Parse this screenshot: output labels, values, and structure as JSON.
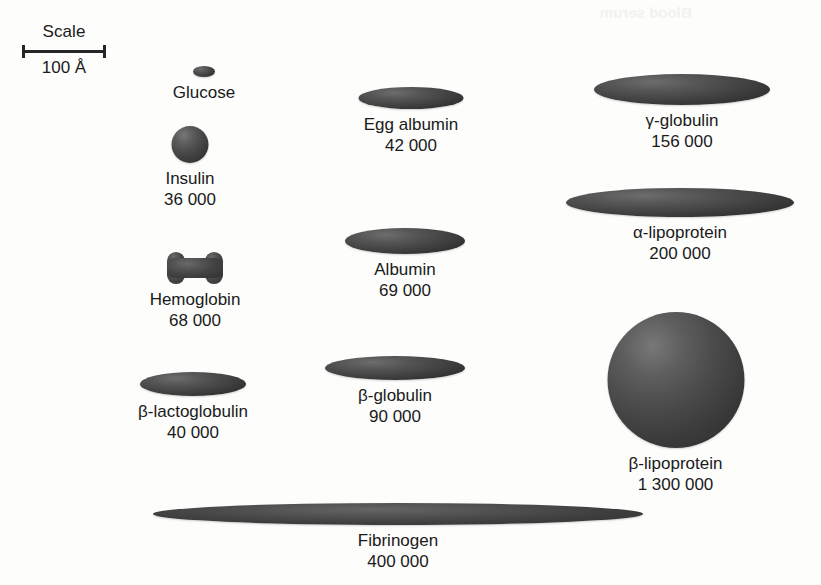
{
  "scale": {
    "title": "Scale",
    "value": "100 Å",
    "bar_pixels": 60,
    "represents_angstroms": 100
  },
  "chart_data": {
    "type": "diagram",
    "subtitle": "",
    "xlabel": "",
    "ylabel": "",
    "units": "molecular weight (daltons)",
    "scale_bar": {
      "label": "100 Å",
      "length_px": 60
    },
    "categories": [
      "Glucose",
      "Insulin",
      "Hemoglobin",
      "β-lactoglobulin",
      "Egg albumin",
      "Albumin",
      "β-globulin",
      "γ-globulin",
      "α-lipoprotein",
      "β-lipoprotein",
      "Fibrinogen"
    ],
    "values": [
      180,
      36000,
      68000,
      40000,
      42000,
      69000,
      90000,
      156000,
      200000,
      1300000,
      400000
    ],
    "value_labels": [
      "",
      "36 000",
      "68 000",
      "40 000",
      "42 000",
      "69 000",
      "90 000",
      "156 000",
      "200 000",
      "1 300 000",
      "400 000"
    ],
    "shapes": [
      "ellipse",
      "sphere",
      "lobed",
      "ellipse",
      "ellipse",
      "ellipse",
      "ellipse",
      "ellipse",
      "ellipse",
      "sphere",
      "ellipse"
    ]
  },
  "molecules": [
    {
      "id": "glucose",
      "name": "Glucose",
      "mass": "",
      "shape": "ellipse",
      "width": 22,
      "height": 11,
      "left": 145,
      "top": 66,
      "box": 118
    },
    {
      "id": "insulin",
      "name": "Insulin",
      "mass": "36 000",
      "shape": "sphere",
      "width": 37,
      "height": 37,
      "left": 120,
      "top": 126,
      "box": 140
    },
    {
      "id": "hemoglobin",
      "name": "Hemoglobin",
      "mass": "68 000",
      "shape": "lobed",
      "width": 56,
      "height": 32,
      "left": 110,
      "top": 252,
      "box": 170
    },
    {
      "id": "beta-lactoglobulin",
      "name": "β-lactoglobulin",
      "mass": "40 000",
      "shape": "ellipse",
      "width": 106,
      "height": 24,
      "left": 110,
      "top": 372,
      "box": 166
    },
    {
      "id": "egg-albumin",
      "name": "Egg albumin",
      "mass": "42 000",
      "shape": "ellipse",
      "width": 105,
      "height": 22,
      "left": 333,
      "top": 87,
      "box": 156
    },
    {
      "id": "albumin",
      "name": "Albumin",
      "mass": "69 000",
      "shape": "ellipse",
      "width": 120,
      "height": 26,
      "left": 327,
      "top": 228,
      "box": 156
    },
    {
      "id": "beta-globulin",
      "name": "β-globulin",
      "mass": "90 000",
      "shape": "ellipse",
      "width": 140,
      "height": 24,
      "left": 317,
      "top": 356,
      "box": 156
    },
    {
      "id": "gamma-globulin",
      "name": "γ-globulin",
      "mass": "156 000",
      "shape": "ellipse",
      "width": 176,
      "height": 31,
      "left": 594,
      "top": 74,
      "box": 176
    },
    {
      "id": "alpha-lipoprotein",
      "name": "α-lipoprotein",
      "mass": "200 000",
      "shape": "ellipse",
      "width": 228,
      "height": 29,
      "left": 566,
      "top": 188,
      "box": 228
    },
    {
      "id": "beta-lipoprotein",
      "name": "β-lipoprotein",
      "mass": "1 300 000",
      "shape": "sphere",
      "width": 137,
      "height": 136,
      "left": 607,
      "top": 312,
      "box": 137
    },
    {
      "id": "fibrinogen",
      "name": "Fibrinogen",
      "mass": "400 000",
      "shape": "ellipse",
      "width": 490,
      "height": 22,
      "left": 153,
      "top": 503,
      "box": 490
    }
  ]
}
